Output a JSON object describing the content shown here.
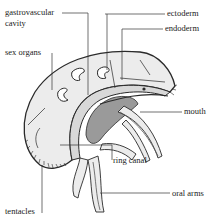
{
  "diagram": {
    "labels": {
      "gastrovascular_cavity_line1": "gastrovascular",
      "gastrovascular_cavity_line2": "cavity",
      "sex_organs": "sex organs",
      "ectoderm": "ectoderm",
      "endoderm": "endoderm",
      "mouth": "mouth",
      "ring_canal": "ring canal",
      "oral_arms": "oral arms",
      "tentacles": "tentacles"
    },
    "colors": {
      "outline": "#2a2a2a",
      "bell_fill": "#ececec",
      "inner_fill": "#d8d8d8",
      "cavity_fill": "#9a9a9a",
      "leader_line": "#333333"
    }
  }
}
